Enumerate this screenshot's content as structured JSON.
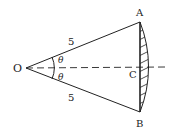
{
  "diagram": {
    "type": "sector-with-shaded-segment",
    "points": {
      "O": {
        "label": "O",
        "x": 26,
        "y": 68
      },
      "A": {
        "label": "A",
        "x": 140,
        "y": 22
      },
      "B": {
        "label": "B",
        "x": 140,
        "y": 112
      },
      "C": {
        "label": "C",
        "x": 140,
        "y": 67
      }
    },
    "labels": {
      "O": "O",
      "A": "A",
      "B": "B",
      "C": "C",
      "side_OA": "5",
      "side_OB": "5",
      "angle_top": "θ",
      "angle_bottom": "θ"
    },
    "colors": {
      "stroke": "#222222",
      "background": "#ffffff"
    }
  }
}
